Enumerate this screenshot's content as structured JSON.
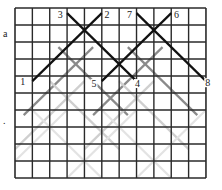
{
  "figure": {
    "type": "grid-diagram",
    "grid": {
      "columns": 11,
      "rows": 10,
      "origin_px": [
        15,
        8
      ],
      "cell_w_px": 17.36,
      "cell_h_px": 17.0,
      "line_color": "#2a2a2a",
      "border_color": "#333333"
    },
    "side_marks": [
      {
        "text": "a",
        "x": 3,
        "y": 34
      },
      {
        "text": ".",
        "x": 3,
        "y": 122
      }
    ],
    "black_segments": [
      {
        "from": "1",
        "to": "2",
        "cells": [
          [
            1,
            4.3
          ],
          [
            5,
            0.3
          ]
        ]
      },
      {
        "from": "3",
        "to": "4",
        "cells": [
          [
            3,
            0.3
          ],
          [
            7,
            4.3
          ]
        ]
      },
      {
        "from": "5",
        "to": "6",
        "cells": [
          [
            5,
            4.3
          ],
          [
            9,
            0.3
          ]
        ]
      },
      {
        "from": "7",
        "to": "8",
        "cells": [
          [
            7,
            0.3
          ],
          [
            11,
            4.3
          ]
        ]
      }
    ],
    "gray_segments": [
      {
        "color": "#8a8a8a",
        "cells": [
          [
            0.5,
            6.3
          ],
          [
            4.5,
            2.3
          ]
        ]
      },
      {
        "color": "#8a8a8a",
        "cells": [
          [
            2.5,
            2.3
          ],
          [
            6.5,
            6.3
          ]
        ]
      },
      {
        "color": "#8a8a8a",
        "cells": [
          [
            4.5,
            6.3
          ],
          [
            8.5,
            2.3
          ]
        ]
      },
      {
        "color": "#8a8a8a",
        "cells": [
          [
            6.5,
            2.3
          ],
          [
            10.5,
            6.3
          ]
        ]
      },
      {
        "color": "#cfcfcf",
        "cells": [
          [
            0,
            8.3
          ],
          [
            4,
            4.3
          ]
        ]
      },
      {
        "color": "#cfcfcf",
        "cells": [
          [
            2,
            4.3
          ],
          [
            6,
            8.3
          ]
        ]
      },
      {
        "color": "#cfcfcf",
        "cells": [
          [
            4,
            8.3
          ],
          [
            8,
            4.3
          ]
        ]
      },
      {
        "color": "#cfcfcf",
        "cells": [
          [
            6,
            4.3
          ],
          [
            10,
            8.3
          ]
        ]
      },
      {
        "color": "#e3e3e3",
        "cells": [
          [
            -1,
            10
          ],
          [
            3,
            6
          ]
        ]
      },
      {
        "color": "#e3e3e3",
        "cells": [
          [
            1,
            6
          ],
          [
            5,
            10
          ]
        ]
      },
      {
        "color": "#e3e3e3",
        "cells": [
          [
            3,
            10
          ],
          [
            7,
            6
          ]
        ]
      },
      {
        "color": "#e3e3e3",
        "cells": [
          [
            5,
            6
          ],
          [
            9,
            10
          ]
        ]
      },
      {
        "color": "#e3e3e3",
        "cells": [
          [
            7,
            10
          ],
          [
            11,
            6
          ]
        ]
      }
    ],
    "point_labels": [
      {
        "text": "1",
        "cx": 0.45,
        "cy": 4.55
      },
      {
        "text": "2",
        "cx": 5.3,
        "cy": 0.6
      },
      {
        "text": "3",
        "cx": 2.6,
        "cy": 0.6
      },
      {
        "text": "4",
        "cx": 7.05,
        "cy": 4.65
      },
      {
        "text": "5",
        "cx": 4.55,
        "cy": 4.65
      },
      {
        "text": "6",
        "cx": 9.3,
        "cy": 0.6
      },
      {
        "text": "7",
        "cx": 6.6,
        "cy": 0.6
      },
      {
        "text": "8",
        "cx": 11.1,
        "cy": 4.6
      }
    ]
  }
}
